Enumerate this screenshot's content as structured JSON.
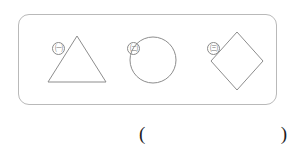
{
  "page": {
    "background_color": "#ffffff",
    "width": 296,
    "height": 157
  },
  "figure_box": {
    "border_color": "#b9b9b9",
    "corner_radius": 11
  },
  "shapes": [
    {
      "marker": "㈠",
      "marker_plain": "(ㄱ)",
      "name": "triangle",
      "label": "triangle",
      "stroke_color": "#8d8d8d"
    },
    {
      "marker": "㈡",
      "marker_plain": "(ㄴ)",
      "name": "circle",
      "label": "circle",
      "stroke_color": "#8d8d8d"
    },
    {
      "marker": "㈢",
      "marker_plain": "(ㄷ)",
      "name": "rhombus",
      "label": "rhombus",
      "stroke_color": "#8d8d8d"
    }
  ],
  "answer_blank": {
    "open_paren": "(",
    "close_paren": ")",
    "value": "",
    "placeholder": ""
  }
}
